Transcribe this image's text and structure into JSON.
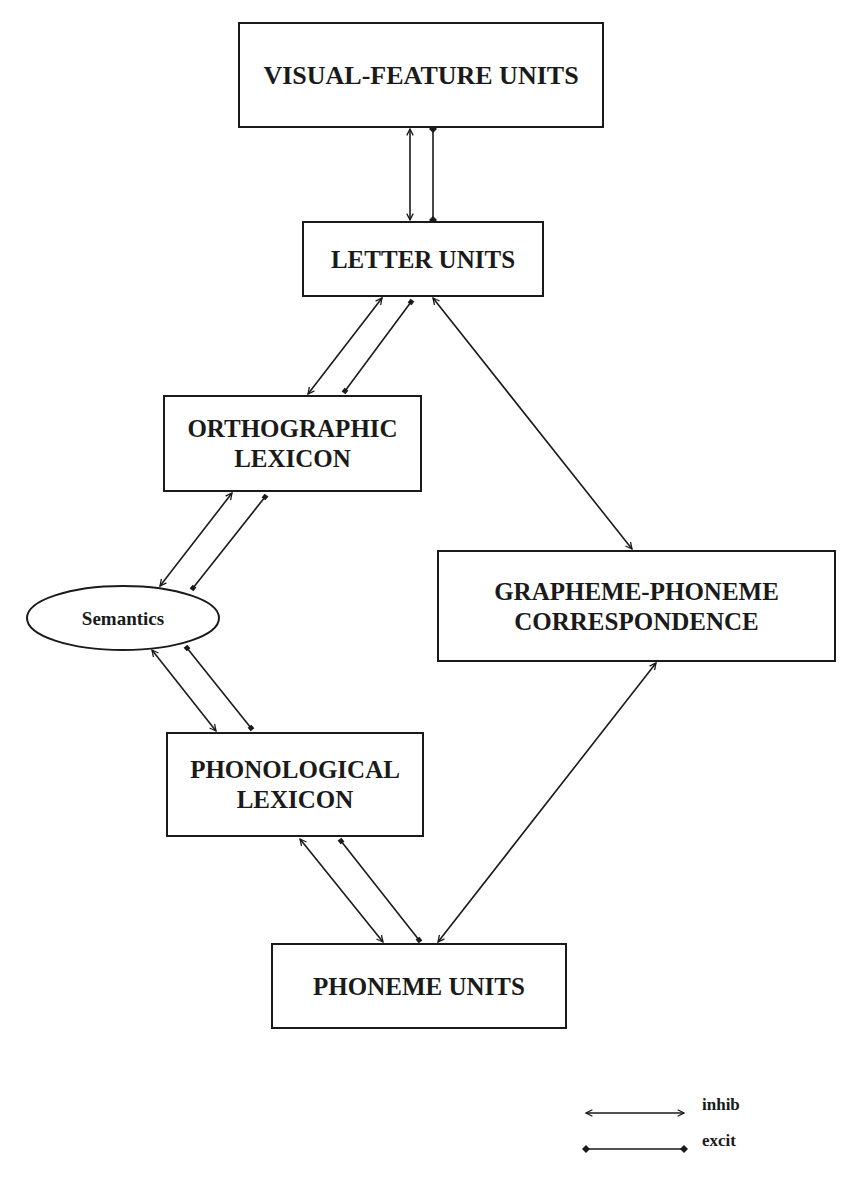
{
  "diagram": {
    "type": "box-and-arrow",
    "colors": {
      "stroke": "#1a1a1a",
      "background": "#ffffff"
    },
    "nodes": [
      {
        "id": "visual",
        "shape": "rect",
        "x": 239,
        "y": 23,
        "w": 364,
        "h": 104,
        "lines": [
          "VISUAL-FEATURE UNITS"
        ],
        "font_size": 26
      },
      {
        "id": "letter",
        "shape": "rect",
        "x": 303,
        "y": 222,
        "w": 240,
        "h": 74,
        "lines": [
          "LETTER UNITS"
        ],
        "font_size": 25
      },
      {
        "id": "ortho",
        "shape": "rect",
        "x": 164,
        "y": 396,
        "w": 257,
        "h": 95,
        "lines": [
          "ORTHOGRAPHIC",
          "LEXICON"
        ],
        "font_size": 25
      },
      {
        "id": "semantics",
        "shape": "ellipse",
        "cx": 123,
        "cy": 618,
        "rx": 96,
        "ry": 32,
        "lines": [
          "Semantics"
        ],
        "font_size": 19
      },
      {
        "id": "gpc",
        "shape": "rect",
        "x": 438,
        "y": 551,
        "w": 397,
        "h": 110,
        "lines": [
          "GRAPHEME-PHONEME",
          "CORRESPONDENCE"
        ],
        "font_size": 25
      },
      {
        "id": "phon",
        "shape": "rect",
        "x": 167,
        "y": 733,
        "w": 256,
        "h": 103,
        "lines": [
          "PHONOLOGICAL",
          "LEXICON"
        ],
        "font_size": 25
      },
      {
        "id": "phoneme",
        "shape": "rect",
        "x": 272,
        "y": 944,
        "w": 294,
        "h": 84,
        "lines": [
          "PHONEME UNITS"
        ],
        "font_size": 25
      }
    ],
    "edges": [
      {
        "from": "visual",
        "to": "letter",
        "kind": "inhib",
        "x1": 410,
        "y1": 129,
        "x2": 410,
        "y2": 220
      },
      {
        "from": "visual",
        "to": "letter",
        "kind": "excit",
        "x1": 433,
        "y1": 129,
        "x2": 433,
        "y2": 220
      },
      {
        "from": "letter",
        "to": "ortho",
        "kind": "inhib",
        "x1": 382,
        "y1": 298,
        "x2": 308,
        "y2": 394
      },
      {
        "from": "letter",
        "to": "ortho",
        "kind": "excit",
        "x1": 411,
        "y1": 302,
        "x2": 345,
        "y2": 391
      },
      {
        "from": "letter",
        "to": "gpc",
        "kind": "inhib",
        "x1": 433,
        "y1": 298,
        "x2": 632,
        "y2": 549
      },
      {
        "from": "ortho",
        "to": "semantics",
        "kind": "inhib",
        "x1": 232,
        "y1": 493,
        "x2": 160,
        "y2": 586
      },
      {
        "from": "ortho",
        "to": "semantics",
        "kind": "excit",
        "x1": 265,
        "y1": 497,
        "x2": 193,
        "y2": 588
      },
      {
        "from": "semantics",
        "to": "phon",
        "kind": "inhib",
        "x1": 152,
        "y1": 650,
        "x2": 216,
        "y2": 731
      },
      {
        "from": "semantics",
        "to": "phon",
        "kind": "excit",
        "x1": 187,
        "y1": 648,
        "x2": 251,
        "y2": 728
      },
      {
        "from": "phon",
        "to": "phoneme",
        "kind": "inhib",
        "x1": 300,
        "y1": 839,
        "x2": 383,
        "y2": 942
      },
      {
        "from": "phon",
        "to": "phoneme",
        "kind": "excit",
        "x1": 341,
        "y1": 841,
        "x2": 419,
        "y2": 940
      },
      {
        "from": "gpc",
        "to": "phoneme",
        "kind": "inhib",
        "x1": 656,
        "y1": 663,
        "x2": 438,
        "y2": 942
      }
    ]
  },
  "legend": {
    "items": [
      {
        "kind": "inhib",
        "label": "inhib",
        "x1": 586,
        "y1": 1113,
        "x2": 684,
        "y2": 1113,
        "tx": 702,
        "ty": 1110
      },
      {
        "kind": "excit",
        "label": "excit",
        "x1": 586,
        "y1": 1149,
        "x2": 684,
        "y2": 1149,
        "tx": 702,
        "ty": 1146
      }
    ]
  }
}
